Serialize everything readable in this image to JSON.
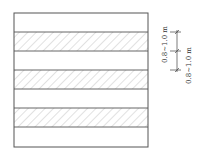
{
  "diagram": {
    "type": "striped-layout-plan",
    "bands": [
      {
        "index": 0,
        "hatched": false
      },
      {
        "index": 1,
        "hatched": true
      },
      {
        "index": 2,
        "hatched": false
      },
      {
        "index": 3,
        "hatched": true
      },
      {
        "index": 4,
        "hatched": false
      },
      {
        "index": 5,
        "hatched": true
      },
      {
        "index": 6,
        "hatched": false
      }
    ],
    "dimensions": [
      {
        "label": "0.8~1.0 m"
      },
      {
        "label": "0.8~1.0 m"
      }
    ],
    "colors": {
      "stroke": "#555555",
      "hatch": "#888888",
      "background": "#ffffff"
    }
  }
}
